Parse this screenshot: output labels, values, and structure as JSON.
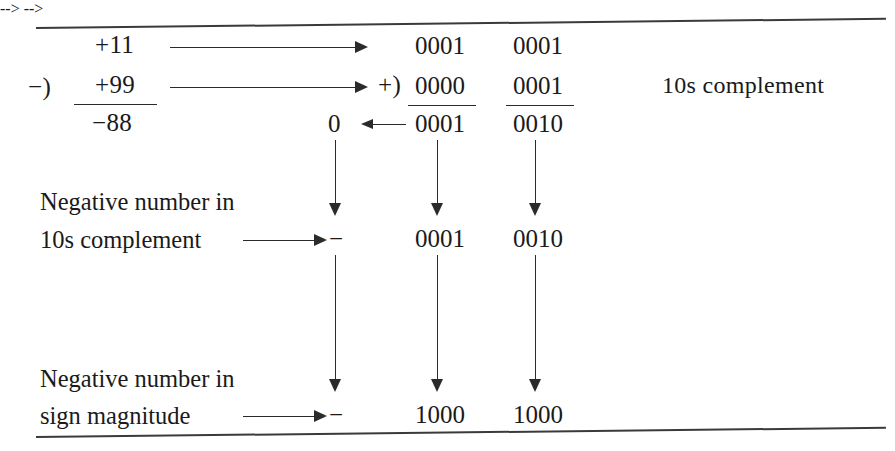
{
  "figure": {
    "decimal": {
      "minuend": "+11",
      "operator": "−)",
      "subtrahend": "+99",
      "result": "−88"
    },
    "bcd": {
      "plus_operator": "+)",
      "carry_digit": "0",
      "row_minuend": [
        "0001",
        "0001"
      ],
      "row_subtrahend": [
        "0000",
        "0001"
      ],
      "row_sum": [
        "0001",
        "0010"
      ]
    },
    "annotations": {
      "tens_complement": "10s complement",
      "neg_10s_line1": "Negative number in",
      "neg_10s_line2": "10s complement",
      "neg_sign_line1": "Negative number in",
      "neg_sign_line2": "sign magnitude"
    },
    "tens_complement_row": {
      "sign": "−",
      "digits": [
        "0001",
        "0010"
      ]
    },
    "sign_magnitude_row": {
      "sign": "−",
      "digits": [
        "1000",
        "1000"
      ]
    },
    "colors": {
      "ink": "#1a1a1a",
      "rule": "#3a3a3a",
      "background": "#ffffff"
    }
  }
}
